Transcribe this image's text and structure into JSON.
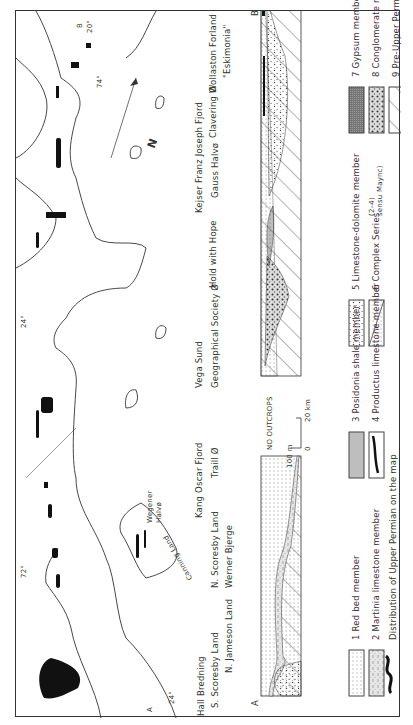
{
  "map": {
    "section_line": {
      "start": "A",
      "end": "B"
    },
    "coordinates": [
      "24°",
      "72°",
      "24°",
      "74°",
      "20°"
    ],
    "north_arrow": "N",
    "place_labels": {
      "wegener_halvo": "Wegener Halvø",
      "wegener": "Wegener",
      "halvo": "Halvø",
      "canning_land": "Canning Land"
    }
  },
  "place_names": {
    "row1": [
      "Hall Bredning",
      "Kang Oscar Fjord",
      "Vega Sund",
      "Kejser Franz Joseph Fjord",
      "Hold with Hope",
      "Clavering Ø",
      "Wollaston Forland"
    ],
    "row2": [
      "S. Scoresby Land",
      "N. Scoresby Land",
      "Traill Ø",
      "Geographical Society Ø",
      "Gauss Halvø",
      "\"Eskimonia\""
    ],
    "row3": [
      "N. Jameson Land",
      "Werner Bjerge"
    ]
  },
  "section": {
    "label_start": "A",
    "label_end": "B",
    "gap_label": "NO OUTCROPS",
    "scale_vertical": "100 m",
    "scale_h_start": "0",
    "scale_h_end": "20 km"
  },
  "legend": [
    {
      "num": "1",
      "label": "1 Red bed member",
      "pattern": "fine-dots"
    },
    {
      "num": "2",
      "label": "2 Martinia limestone member",
      "pattern": "dashes-dots"
    },
    {
      "num": "3",
      "label": "3 Posidonia shale member",
      "pattern": "vertical-lines"
    },
    {
      "num": "4",
      "label": "4 Productus limestone member",
      "pattern": "black-lens"
    },
    {
      "num": "5",
      "label": "5 Limestone-dolomite member",
      "pattern": "coarse-dots"
    },
    {
      "num": "6",
      "label": "6 Complex Series",
      "sub_a": "(2–4)",
      "sub_b": "sensu Maync)",
      "pattern": "diagonal-split"
    },
    {
      "num": "7",
      "label": "7 Gypsum member",
      "pattern": "dark-grid"
    },
    {
      "num": "8",
      "label": "8 Conglomerate member",
      "pattern": "conglomerate"
    },
    {
      "num": "9",
      "label": "9 Pre-Upper Permian",
      "pattern": "diagonal-hatch"
    }
  ],
  "distribution_label": "Distribution of Upper Permian on the map",
  "colors": {
    "ink": "#222222",
    "paper": "#ffffff",
    "gray": "#bbbbbb"
  }
}
